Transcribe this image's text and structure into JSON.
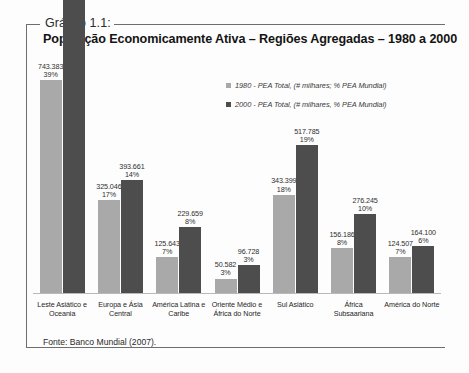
{
  "figure": {
    "number_label": "Gráfico 1.1:",
    "title": "População Economicamente Ativa – Regiões Agregadas – 1980 a 2000",
    "source": "Fonte: Banco Mundial (2007)."
  },
  "legend": {
    "items": [
      {
        "label": "1980 - PEA Total, (# milhares; % PEA Mundial)",
        "color": "#a9a9a9"
      },
      {
        "label": "2000 - PEA Total, (# milhares, % PEA Mundial)",
        "color": "#4d4d4d"
      }
    ]
  },
  "chart_data": {
    "type": "bar",
    "title": "População Economicamente Ativa – Regiões Agregadas – 1980 a 2000",
    "xlabel": "",
    "ylabel": "",
    "grid": false,
    "legend_position": "top-right",
    "ylim": [
      0,
      820000
    ],
    "categories": [
      "Leste Asiático e Oceania",
      "Europa e Ásia Central",
      "América Latina e Caribe",
      "Oriente Médio e África do Norte",
      "Sul Asiático",
      "África Subsaariana",
      "América do Norte"
    ],
    "series": [
      {
        "name": "1980 - PEA Total, (# milhares; % PEA Mundial)",
        "color": "#a9a9a9",
        "values": [
          743383,
          325046,
          125643,
          50582,
          343399,
          156186,
          124507
        ],
        "value_labels": [
          "743.383",
          "325.046",
          "125.643",
          "50.582",
          "343.399",
          "156.186",
          "124.507"
        ],
        "pct_labels": [
          "39%",
          "17%",
          "7%",
          "3%",
          "18%",
          "8%",
          "7%"
        ]
      },
      {
        "name": "2000 - PEA Total, (# milhares, % PEA Mundial)",
        "color": "#4d4d4d",
        "values": [
          1030000,
          393661,
          229659,
          96728,
          517785,
          276245,
          164100
        ],
        "value_labels": [
          "",
          "393.661",
          "229.659",
          "96.728",
          "517.785",
          "276.245",
          "164.100"
        ],
        "pct_labels": [
          "39%",
          "14%",
          "8%",
          "3%",
          "19%",
          "10%",
          "6%"
        ]
      }
    ]
  }
}
